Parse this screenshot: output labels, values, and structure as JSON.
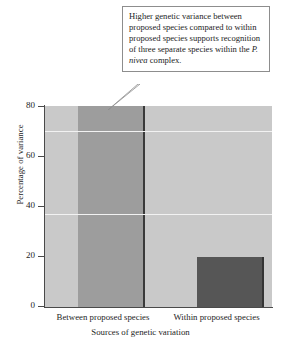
{
  "chart_data": {
    "type": "bar",
    "title": "",
    "xlabel": "Sources of genetic variation",
    "ylabel": "Percentage of variance",
    "categories": [
      "Between proposed species",
      "Within proposed species"
    ],
    "values": [
      80,
      20
    ],
    "ylim": [
      0,
      80
    ],
    "yticks": [
      0,
      20,
      40,
      60,
      80
    ],
    "ytick_labels": [
      "0",
      "20",
      "40",
      "60",
      "80"
    ],
    "grid": true,
    "gridlines": [
      70,
      37
    ],
    "legend": "none",
    "bar_colors": [
      "#9d9d9d",
      "#565656"
    ],
    "plot_background": "#c9c9c9",
    "gridline_color": "#f2f2f2",
    "axis_color": "#4a4a4a"
  },
  "callout": {
    "text_before": "Higher genetic variance between proposed species compared to within proposed species supports recognition of three separate species within the ",
    "species_italic": "P. nivea",
    "text_after": " complex.",
    "border_color": "#8d8d8d",
    "background": "#ffffff",
    "points_to": "Between proposed species"
  }
}
